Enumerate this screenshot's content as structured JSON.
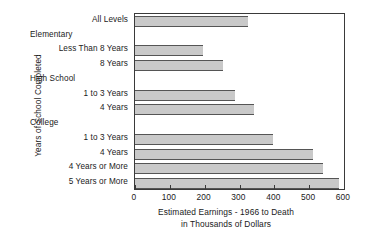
{
  "chart_data": {
    "type": "bar",
    "orientation": "horizontal",
    "title": "",
    "xlabel_line1": "Estimated Earnings - 1966 to Death",
    "xlabel_line2": "in Thousands of Dollars",
    "ylabel": "Years of School Completed",
    "xlim": [
      0,
      600
    ],
    "xticks": [
      0,
      100,
      200,
      300,
      400,
      500,
      600
    ],
    "xticklabels": [
      "0",
      "100",
      "200",
      "300",
      "400",
      "500",
      "600"
    ],
    "grid": false,
    "legend": null,
    "bar_color": "#c9c9c9",
    "bar_edge_color": "#555555",
    "axes_color": "#3a3a3a",
    "categories": [
      "All Levels",
      "Less Than 8 Years",
      "8 Years",
      "1 to  3 Years",
      "4 Years",
      "1 to  3 Years",
      "4 Years",
      "4 Years or More",
      "5 Years or More"
    ],
    "values": [
      323,
      194,
      252,
      286,
      343,
      397,
      512,
      540,
      585
    ],
    "group_headers": [
      "Elementary",
      "High School",
      "College"
    ],
    "rows": [
      {
        "kind": "bar",
        "label": "All Levels",
        "value": 323,
        "group": null
      },
      {
        "kind": "header",
        "label": "Elementary",
        "value": null,
        "group": "Elementary"
      },
      {
        "kind": "bar",
        "label": "Less Than 8 Years",
        "value": 194,
        "group": "Elementary"
      },
      {
        "kind": "bar",
        "label": "8 Years",
        "value": 252,
        "group": "Elementary"
      },
      {
        "kind": "header",
        "label": "High School",
        "value": null,
        "group": "High School"
      },
      {
        "kind": "bar",
        "label": "1 to  3 Years",
        "value": 286,
        "group": "High School"
      },
      {
        "kind": "bar",
        "label": "4 Years",
        "value": 343,
        "group": "High School"
      },
      {
        "kind": "header",
        "label": "College",
        "value": null,
        "group": "College"
      },
      {
        "kind": "bar",
        "label": "1 to  3 Years",
        "value": 397,
        "group": "College"
      },
      {
        "kind": "bar",
        "label": "4 Years",
        "value": 512,
        "group": "College"
      },
      {
        "kind": "bar",
        "label": "4 Years or More",
        "value": 540,
        "group": "College"
      },
      {
        "kind": "bar",
        "label": "5 Years or More",
        "value": 585,
        "group": "College"
      }
    ]
  }
}
